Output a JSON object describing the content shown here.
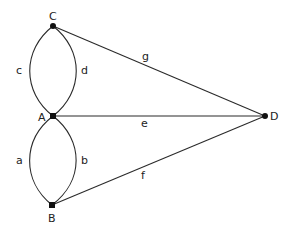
{
  "diagram": {
    "type": "graph",
    "vertices": [
      {
        "id": "C",
        "label": "C",
        "x": 53,
        "y": 26
      },
      {
        "id": "A",
        "label": "A",
        "x": 53,
        "y": 116
      },
      {
        "id": "B",
        "label": "B",
        "x": 52,
        "y": 205
      },
      {
        "id": "D",
        "label": "D",
        "x": 265,
        "y": 116
      }
    ],
    "edges": [
      {
        "id": "a",
        "label": "a",
        "from": "A",
        "to": "B",
        "shape": "curve-left"
      },
      {
        "id": "b",
        "label": "b",
        "from": "A",
        "to": "B",
        "shape": "curve-right"
      },
      {
        "id": "c",
        "label": "c",
        "from": "C",
        "to": "A",
        "shape": "curve-left"
      },
      {
        "id": "d",
        "label": "d",
        "from": "C",
        "to": "A",
        "shape": "curve-right"
      },
      {
        "id": "e",
        "label": "e",
        "from": "A",
        "to": "D",
        "shape": "straight"
      },
      {
        "id": "f",
        "label": "f",
        "from": "B",
        "to": "D",
        "shape": "straight"
      },
      {
        "id": "g",
        "label": "g",
        "from": "C",
        "to": "D",
        "shape": "straight"
      }
    ],
    "colors": {
      "edge": "#2a2a2a",
      "vertex": "#111111",
      "text": "#222222",
      "background": "#ffffff"
    }
  }
}
